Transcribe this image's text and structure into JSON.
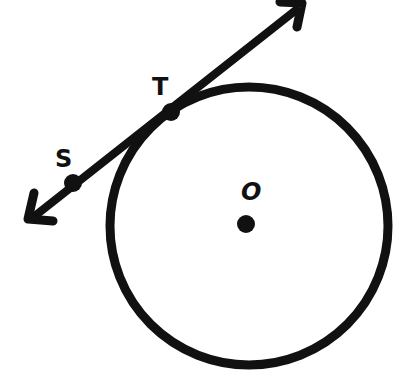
{
  "diagram": {
    "type": "circle-tangent",
    "colors": {
      "stroke": "#111111",
      "background": "#ffffff"
    },
    "circle": {
      "center_label": "O",
      "cx": 249,
      "cy": 226,
      "r": 139
    },
    "tangent_line": {
      "arrow_start": [
        30,
        220
      ],
      "arrow_end": [
        303,
        4
      ],
      "points": [
        {
          "label": "S",
          "x": 73,
          "y": 183
        },
        {
          "label": "T",
          "x": 171,
          "y": 112
        }
      ]
    },
    "labels": {
      "S": "S",
      "T": "T",
      "O": "O"
    }
  }
}
